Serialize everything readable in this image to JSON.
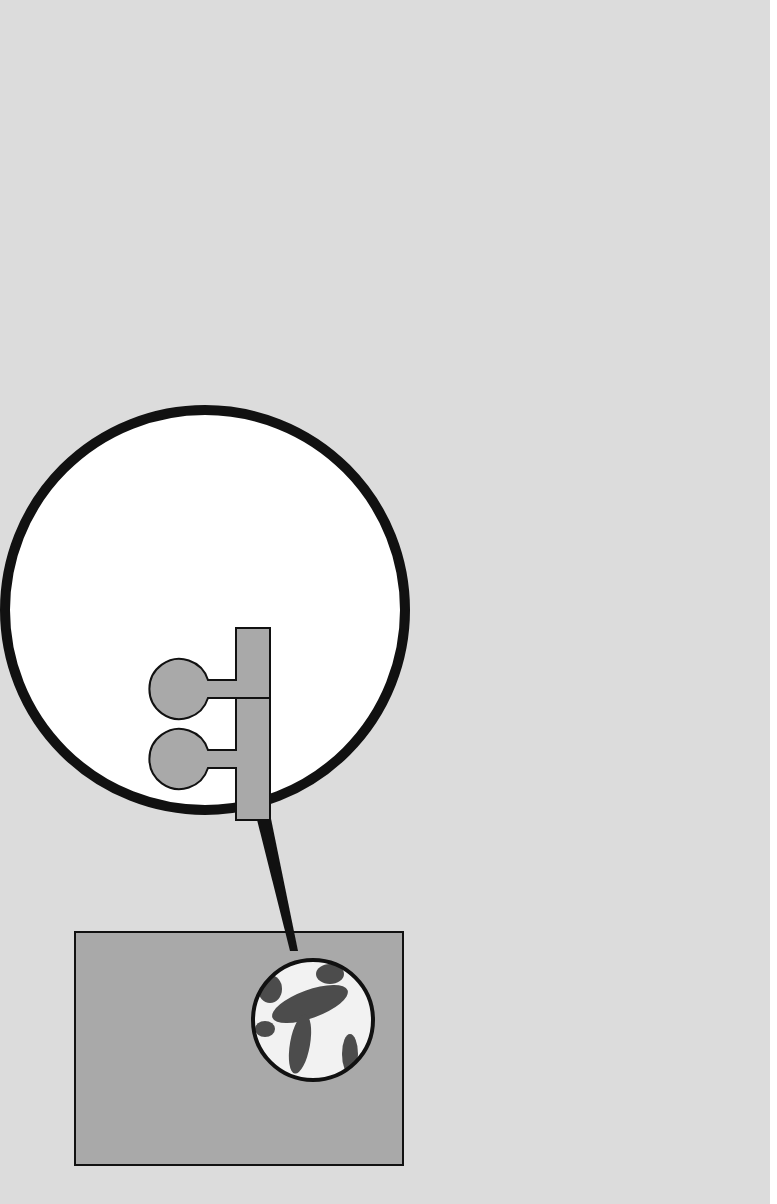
{
  "title": {
    "lines": [
      "Energy Transduction",
      "in \"Supermolecules\"",
      "of a Mitochondrion"
    ]
  },
  "magnifier": {
    "labels": {
      "headpiece": "Headpiece",
      "stalk": "Stalk",
      "base_piece": "Base piece"
    },
    "unit_count": 4
  },
  "stages": [
    {
      "id": "energizing",
      "head_text": [
        "ADP",
        "P",
        "i"
      ],
      "base_left_label": "SH₂ → 2H",
      "caption": [
        "Energizing the",
        "\"Supermolecule\""
      ]
    },
    {
      "id": "induced-field",
      "head_text": [
        "ADP",
        "P",
        "i"
      ],
      "base_left_label": "S",
      "base_right_label": "A",
      "caption": [
        "Generation of an",
        "Induced",
        "Electric Field"
      ]
    },
    {
      "id": "discharge",
      "head_text": [
        "ADP—P",
        "i",
        "(ATP)"
      ],
      "base_left_label": "S",
      "base_right_label": "AH₂",
      "caption": [
        "Discharge of the",
        "Electric Field with",
        "the Simultaneous",
        "Synthesis of ATP"
      ]
    }
  ],
  "colors": {
    "background": "#dcdcdc",
    "shape_fill": "#a9a9a9",
    "outline": "#111111",
    "caption": "#8c8c8c",
    "magnifier_fill": "#ffffff"
  }
}
